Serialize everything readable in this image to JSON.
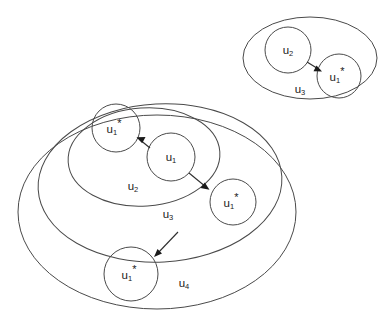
{
  "diagram": {
    "type": "nested-set-venn-diagram",
    "background_color": "#ffffff",
    "line_color": "#4a4a4a",
    "text_color": "#1a1a1a",
    "groups": [
      {
        "id": "top-right-group",
        "set_label": "u",
        "set_label_sub": "3",
        "nodes": [
          {
            "id": "tr-u2",
            "base": "u",
            "sub": "2",
            "star": ""
          },
          {
            "id": "tr-u1star",
            "base": "u",
            "sub": "1",
            "star": "*"
          }
        ],
        "edges": [
          {
            "from": "tr-u2",
            "to": "tr-u1star"
          }
        ]
      },
      {
        "id": "main-group",
        "sets": [
          {
            "id": "set-u2",
            "base": "u",
            "sub": "2"
          },
          {
            "id": "set-u3",
            "base": "u",
            "sub": "3"
          },
          {
            "id": "set-u4",
            "base": "u",
            "sub": "4"
          }
        ],
        "nodes": [
          {
            "id": "m-u1star-inner",
            "base": "u",
            "sub": "1",
            "star": "*"
          },
          {
            "id": "m-u1",
            "base": "u",
            "sub": "1",
            "star": ""
          },
          {
            "id": "m-u1star-right",
            "base": "u",
            "sub": "1",
            "star": "*"
          },
          {
            "id": "m-u1star-bottom",
            "base": "u",
            "sub": "1",
            "star": "*"
          }
        ],
        "edges": [
          {
            "from": "m-u1",
            "to": "m-u1star-inner"
          },
          {
            "from": "m-u1",
            "to": "m-u1star-right"
          },
          {
            "from": "set-u3",
            "to": "m-u1star-bottom"
          }
        ]
      }
    ],
    "labels": {
      "tr_u2_base": "u",
      "tr_u2_sub": "2",
      "tr_u1s_base": "u",
      "tr_u1s_sub": "1",
      "tr_u1s_star": "*",
      "tr_set_base": "u",
      "tr_set_sub": "3",
      "m_u1s_in_base": "u",
      "m_u1s_in_sub": "1",
      "m_u1s_in_star": "*",
      "m_u1_base": "u",
      "m_u1_sub": "1",
      "m_u1s_r_base": "u",
      "m_u1s_r_sub": "1",
      "m_u1s_r_star": "*",
      "m_u1s_b_base": "u",
      "m_u1s_b_sub": "1",
      "m_u1s_b_star": "*",
      "m_set_u2_base": "u",
      "m_set_u2_sub": "2",
      "m_set_u3_base": "u",
      "m_set_u3_sub": "3",
      "m_set_u4_base": "u",
      "m_set_u4_sub": "4"
    }
  }
}
